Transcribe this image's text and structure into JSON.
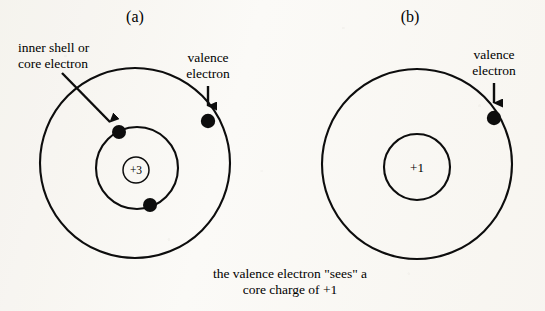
{
  "figure": {
    "background_color": "#fbfaf7",
    "ink_color": "#0d0d0d",
    "panels": [
      {
        "id": "a",
        "label": "(a)",
        "nucleus_charge": "+3",
        "annotations": [
          {
            "name": "inner-shell-label",
            "line1": "inner shell or",
            "line2": "core electron"
          },
          {
            "name": "valence-label",
            "line1": "valence",
            "line2": "electron"
          }
        ],
        "shells": [
          {
            "name": "outer-shell",
            "electron_count": 1
          },
          {
            "name": "inner-shell",
            "electron_count": 2
          }
        ]
      },
      {
        "id": "b",
        "label": "(b)",
        "nucleus_charge": "+1",
        "annotations": [
          {
            "name": "valence-label",
            "line1": "valence",
            "line2": "electron"
          }
        ],
        "shells": [
          {
            "name": "outer-shell",
            "electron_count": 1
          },
          {
            "name": "core-circle",
            "electron_count": 0
          }
        ]
      }
    ],
    "caption": {
      "line1": "the valence electron \"sees\" a",
      "line2": "core charge of +1"
    }
  }
}
